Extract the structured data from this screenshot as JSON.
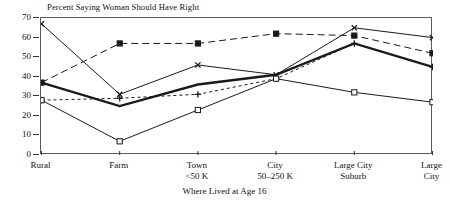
{
  "chart_data": {
    "type": "line",
    "title": "Percent Saying Woman Should Have Right",
    "xlabel": "Where Lived at Age 16",
    "ylabel": "",
    "ylim": [
      0,
      70
    ],
    "yticks": [
      0,
      10,
      20,
      30,
      40,
      50,
      60,
      70
    ],
    "grid": false,
    "legend": "none",
    "categories": [
      "Rural",
      "Farm",
      "Town <50 K",
      "City 50-250 K",
      "Large City Suburb",
      "Large City"
    ],
    "category_lines": [
      [
        "Rural",
        ""
      ],
      [
        "Farm",
        ""
      ],
      [
        "Town",
        "<50 K"
      ],
      [
        "City",
        "50–250 K"
      ],
      [
        "Large City",
        "Suburb"
      ],
      [
        "Large",
        "City"
      ]
    ],
    "series": [
      {
        "name": "series-x-solid",
        "marker": "x",
        "line_style": "solid",
        "line_width": "thin",
        "values": [
          67,
          31,
          46,
          41,
          65,
          60
        ]
      },
      {
        "name": "series-filled-square-dashed",
        "marker": "filled-square",
        "line_style": "dashed",
        "line_width": "thin",
        "values": [
          37,
          57,
          57,
          62,
          61,
          52
        ]
      },
      {
        "name": "series-thick-solid",
        "marker": "none",
        "line_style": "solid",
        "line_width": "thick",
        "values": [
          37,
          25,
          36,
          41,
          57,
          45
        ]
      },
      {
        "name": "series-plus-dotted",
        "marker": "plus",
        "line_style": "dotted",
        "line_width": "thin",
        "values": [
          28,
          29,
          31,
          39,
          57,
          45
        ]
      },
      {
        "name": "series-open-square-solid",
        "marker": "open-square",
        "line_style": "solid",
        "line_width": "thin",
        "values": [
          28,
          7,
          23,
          39,
          32,
          27
        ]
      }
    ],
    "colors": {
      "ink": "#1a1a1a",
      "frame": "#5a5a5a",
      "background": "#ffffff"
    }
  }
}
